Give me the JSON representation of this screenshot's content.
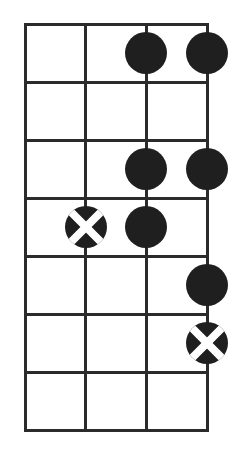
{
  "diagram": {
    "type": "fretboard-scale-diagram",
    "strings": 4,
    "frets": 7,
    "colors": {
      "background": "#ffffff",
      "line": "#2b2b2b",
      "dot_fill": "#1f1f1f",
      "x_stroke": "#ffffff"
    },
    "geometry": {
      "left": 25,
      "top": 24,
      "right": 207,
      "bottom": 430,
      "line_thickness": 3,
      "dot_radius": 21,
      "x_stroke_width": 8
    },
    "markers": [
      {
        "string": 3,
        "fret": 1,
        "kind": "dot"
      },
      {
        "string": 4,
        "fret": 1,
        "kind": "dot"
      },
      {
        "string": 3,
        "fret": 3,
        "kind": "dot"
      },
      {
        "string": 4,
        "fret": 3,
        "kind": "dot"
      },
      {
        "string": 2,
        "fret": 4,
        "kind": "x"
      },
      {
        "string": 3,
        "fret": 4,
        "kind": "dot"
      },
      {
        "string": 4,
        "fret": 5,
        "kind": "dot"
      },
      {
        "string": 4,
        "fret": 6,
        "kind": "x"
      }
    ]
  }
}
